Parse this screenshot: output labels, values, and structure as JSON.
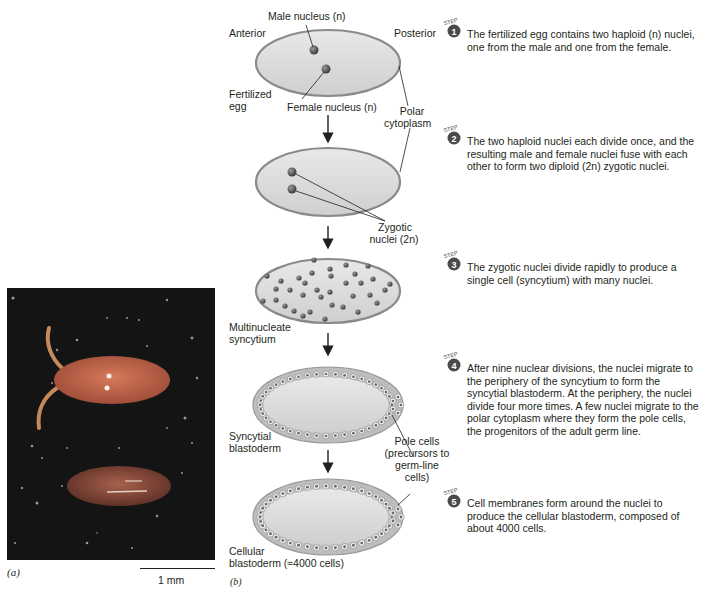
{
  "figure": {
    "panel_a": {
      "letter": "(a)",
      "scale_bar_label": "1 mm",
      "photo_description": "micrograph of Drosophila eggs"
    },
    "panel_b": {
      "letter": "(b)"
    }
  },
  "stage1": {
    "anterior": "Anterior",
    "posterior": "Posterior",
    "male_nucleus": "Male nucleus (n)",
    "female_nucleus": "Female nucleus (n)",
    "fertilized_egg_line1": "Fertilized",
    "fertilized_egg_line2": "egg",
    "polar_line1": "Polar",
    "polar_line2": "cytoplasm"
  },
  "stage2": {
    "zygotic_line1": "Zygotic",
    "zygotic_line2": "nuclei (2n)"
  },
  "stage3": {
    "label_line1": "Multinucleate",
    "label_line2": "syncytium"
  },
  "stage4": {
    "label_line1": "Syncytial",
    "label_line2": "blastoderm",
    "pole_line1": "Pole cells",
    "pole_line2": "(precursors to",
    "pole_line3": "germ-line",
    "pole_line4": "cells)"
  },
  "stage5": {
    "label_line1": "Cellular",
    "label_line2": "blastoderm (≈4000 cells)"
  },
  "steps": [
    {
      "badge": "STEP",
      "number": "1",
      "text": "The fertilized egg contains two haploid (n) nuclei, one from the male and one from the female."
    },
    {
      "badge": "STEP",
      "number": "2",
      "text": "The two haploid nuclei each divide once, and the resulting male and female nuclei fuse with each other to form two diploid (2n) zygotic nuclei."
    },
    {
      "badge": "STEP",
      "number": "3",
      "text": "The zygotic nuclei divide rapidly to produce a single cell (syncytium) with many nuclei."
    },
    {
      "badge": "STEP",
      "number": "4",
      "text": "After nine nuclear divisions, the nuclei migrate to the periphery of the syncytium to form the syncytial blastoderm. At the periphery, the nuclei divide four more times. A few nuclei migrate to the polar cytoplasm where they form the pole cells, the progenitors of the adult germ line."
    },
    {
      "badge": "STEP",
      "number": "5",
      "text": "Cell membranes form around the nuclei to produce the cellular blastoderm, composed of about 4000 cells."
    }
  ],
  "colors": {
    "egg_fill": "#d8d8d8",
    "egg_outline": "#8a8a8a",
    "nucleus": "#5a5a5a",
    "badge": "#4a4a4a",
    "photo_bg": "#141414",
    "egg_photo": "#c86a50"
  }
}
